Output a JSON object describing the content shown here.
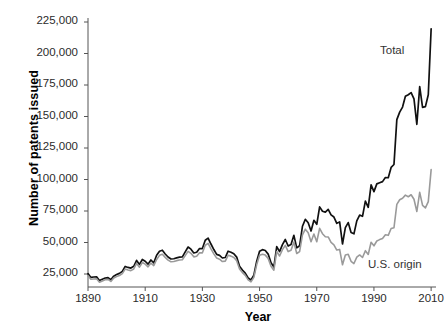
{
  "chart_data": {
    "type": "line",
    "title": "",
    "xlabel": "Year",
    "ylabel": "Number of patents issued",
    "xlim": [
      1890,
      2011
    ],
    "ylim": [
      15000,
      228000
    ],
    "grid": false,
    "legend_position": "inline-annotation",
    "ytick_labels": [
      "25,000",
      "50,000",
      "75,000",
      "100,000",
      "125,000",
      "150,000",
      "175,000",
      "200,000",
      "225,000"
    ],
    "ytick_values": [
      25000,
      50000,
      75000,
      100000,
      125000,
      150000,
      175000,
      200000,
      225000
    ],
    "xtick_labels": [
      "1890",
      "1910",
      "1930",
      "1950",
      "1970",
      "1990",
      "2010"
    ],
    "xtick_values": [
      1890,
      1910,
      1930,
      1950,
      1970,
      1990,
      2010
    ],
    "series": [
      {
        "name": "Total",
        "color": "#111111",
        "label_text": "Total",
        "x": [
          1890,
          1891,
          1892,
          1893,
          1894,
          1895,
          1896,
          1897,
          1898,
          1899,
          1900,
          1901,
          1902,
          1903,
          1904,
          1905,
          1906,
          1907,
          1908,
          1909,
          1910,
          1911,
          1912,
          1913,
          1914,
          1915,
          1916,
          1917,
          1918,
          1919,
          1920,
          1921,
          1922,
          1923,
          1924,
          1925,
          1926,
          1927,
          1928,
          1929,
          1930,
          1931,
          1932,
          1933,
          1934,
          1935,
          1936,
          1937,
          1938,
          1939,
          1940,
          1941,
          1942,
          1943,
          1944,
          1945,
          1946,
          1947,
          1948,
          1949,
          1950,
          1951,
          1952,
          1953,
          1954,
          1955,
          1956,
          1957,
          1958,
          1959,
          1960,
          1961,
          1962,
          1963,
          1964,
          1965,
          1966,
          1967,
          1968,
          1969,
          1970,
          1971,
          1972,
          1973,
          1974,
          1975,
          1976,
          1977,
          1978,
          1979,
          1980,
          1981,
          1982,
          1983,
          1984,
          1985,
          1986,
          1987,
          1988,
          1989,
          1990,
          1991,
          1992,
          1993,
          1994,
          1995,
          1996,
          1997,
          1998,
          1999,
          2000,
          2001,
          2002,
          2003,
          2004,
          2005,
          2006,
          2007,
          2008,
          2009,
          2010
        ],
        "values": [
          25300,
          22300,
          22600,
          22800,
          19900,
          20900,
          21800,
          22100,
          20400,
          23300,
          24600,
          25500,
          27100,
          31000,
          30200,
          29700,
          31100,
          35800,
          32600,
          36500,
          35100,
          32800,
          36100,
          33900,
          39900,
          43100,
          43900,
          40900,
          38500,
          36900,
          37100,
          37800,
          38400,
          38600,
          42600,
          46400,
          44700,
          41700,
          42300,
          45200,
          45200,
          51800,
          53500,
          48800,
          44400,
          40600,
          39800,
          37700,
          38100,
          43100,
          42300,
          41100,
          38400,
          31100,
          28100,
          25700,
          21800,
          20200,
          24000,
          35100,
          43100,
          44300,
          43600,
          40800,
          33900,
          30500,
          46700,
          42800,
          48300,
          52400,
          47200,
          48400,
          55700,
          45700,
          47400,
          62900,
          68400,
          65700,
          59100,
          67600,
          64400,
          78300,
          74800,
          74100,
          76300,
          71900,
          70200,
          65200,
          66300,
          48800,
          61800,
          65800,
          57900,
          56900,
          67200,
          71700,
          70800,
          82900,
          77900,
          95700,
          90400,
          96500,
          97400,
          98300,
          101600,
          101400,
          109600,
          111900,
          147500,
          153500,
          157500,
          166000,
          167300,
          169000,
          164000,
          143800,
          173700,
          157300,
          157800,
          167300,
          219600
        ]
      },
      {
        "name": "U.S. origin",
        "color": "#9a9a9a",
        "label_text": "U.S. origin",
        "x": [
          1890,
          1891,
          1892,
          1893,
          1894,
          1895,
          1896,
          1897,
          1898,
          1899,
          1900,
          1901,
          1902,
          1903,
          1904,
          1905,
          1906,
          1907,
          1908,
          1909,
          1910,
          1911,
          1912,
          1913,
          1914,
          1915,
          1916,
          1917,
          1918,
          1919,
          1920,
          1921,
          1922,
          1923,
          1924,
          1925,
          1926,
          1927,
          1928,
          1929,
          1930,
          1931,
          1932,
          1933,
          1934,
          1935,
          1936,
          1937,
          1938,
          1939,
          1940,
          1941,
          1942,
          1943,
          1944,
          1945,
          1946,
          1947,
          1948,
          1949,
          1950,
          1951,
          1952,
          1953,
          1954,
          1955,
          1956,
          1957,
          1958,
          1959,
          1960,
          1961,
          1962,
          1963,
          1964,
          1965,
          1966,
          1967,
          1968,
          1969,
          1970,
          1971,
          1972,
          1973,
          1974,
          1975,
          1976,
          1977,
          1978,
          1979,
          1980,
          1981,
          1982,
          1983,
          1984,
          1985,
          1986,
          1987,
          1988,
          1989,
          1990,
          1991,
          1992,
          1993,
          1994,
          1995,
          1996,
          1997,
          1998,
          1999,
          2000,
          2001,
          2002,
          2003,
          2004,
          2005,
          2006,
          2007,
          2008,
          2009,
          2010
        ],
        "values": [
          23600,
          20800,
          21000,
          21200,
          18500,
          19500,
          20400,
          20700,
          19100,
          21800,
          23000,
          23800,
          25300,
          28900,
          28200,
          27700,
          29000,
          33400,
          30400,
          34100,
          32800,
          30700,
          33700,
          31700,
          36500,
          39800,
          40700,
          38200,
          36000,
          34700,
          34900,
          35600,
          36100,
          36300,
          39600,
          43000,
          41400,
          38600,
          39100,
          41800,
          41800,
          47800,
          49300,
          45000,
          41000,
          37600,
          36800,
          34900,
          35200,
          39800,
          39200,
          38100,
          35600,
          28900,
          26100,
          23900,
          20300,
          18800,
          22300,
          32500,
          39900,
          40700,
          40000,
          37400,
          31200,
          28000,
          42900,
          39300,
          44300,
          47700,
          42800,
          43800,
          50300,
          41300,
          42800,
          56100,
          60600,
          57700,
          50600,
          56700,
          50600,
          61200,
          57000,
          54600,
          54400,
          50100,
          48200,
          44000,
          44500,
          32300,
          40100,
          40600,
          35100,
          33300,
          38400,
          40100,
          38100,
          43500,
          40500,
          50200,
          47400,
          51200,
          52300,
          53200,
          56100,
          55700,
          61100,
          61700,
          80300,
          83900,
          85100,
          87600,
          86300,
          87900,
          84300,
          74600,
          89800,
          79500,
          77500,
          82400,
          107800
        ]
      }
    ],
    "annotations": [
      {
        "text": "Total",
        "x": 2001,
        "y": 205000
      },
      {
        "text": "U.S. origin",
        "x": 1995,
        "y": 34000
      }
    ]
  },
  "axis": {
    "y_title": "Number of patents issued",
    "x_title": "Year"
  }
}
